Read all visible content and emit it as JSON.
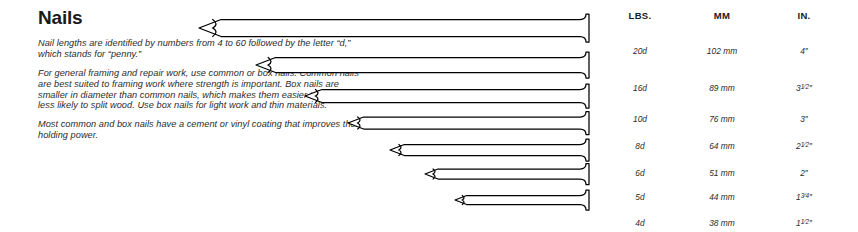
{
  "article": {
    "title": "Nails",
    "paragraphs": [
      "Nail lengths are identified by numbers from 4 to 60 followed by the letter “d,” which stands for “penny.”",
      "For general framing and repair work, use common or box nails. Common nails are best suited to framing work where strength is important. Box nails are smaller in diameter than common nails, which makes them easier to drive and less likely to split wood. Use box nails for light work and thin materials.",
      "Most common and box nails have a cement or vinyl coating that improves their holding power."
    ]
  },
  "table": {
    "headers": [
      "LBS.",
      "MM",
      "IN."
    ],
    "rows": [
      {
        "lbs": "20d",
        "mm": "102 mm",
        "in": "4″",
        "in_whole": "4",
        "in_frac": ""
      },
      {
        "lbs": "16d",
        "mm": "89 mm",
        "in": "3½″",
        "in_whole": "3",
        "in_frac": "1/2"
      },
      {
        "lbs": "10d",
        "mm": "76 mm",
        "in": "3″",
        "in_whole": "3",
        "in_frac": ""
      },
      {
        "lbs": "8d",
        "mm": "64 mm",
        "in": "2½″",
        "in_whole": "2",
        "in_frac": "1/2"
      },
      {
        "lbs": "6d",
        "mm": "51 mm",
        "in": "2″",
        "in_whole": "2",
        "in_frac": ""
      },
      {
        "lbs": "5d",
        "mm": "44 mm",
        "in": "1¾″",
        "in_whole": "1",
        "in_frac": "3/4"
      },
      {
        "lbs": "4d",
        "mm": "38 mm",
        "in": "1½″",
        "in_whole": "1",
        "in_frac": "1/2"
      }
    ]
  },
  "chart_data": {
    "type": "bar",
    "title": "Nails",
    "xlabel": "Length",
    "ylabel": "Nail size (penny)",
    "categories": [
      "20d",
      "16d",
      "10d",
      "8d",
      "6d",
      "5d",
      "4d"
    ],
    "series": [
      {
        "name": "Length (mm)",
        "values": [
          102,
          89,
          76,
          64,
          51,
          44,
          38
        ]
      },
      {
        "name": "Length (inches)",
        "values": [
          4,
          3.5,
          3,
          2.5,
          2,
          1.75,
          1.5
        ]
      }
    ],
    "orientation": "horizontal",
    "anchor": "right",
    "grid": false,
    "legend": "none",
    "xlim": [
      0,
      4
    ],
    "annotations": [
      "Nails are drawn to scale, heads aligned at right, points at left.",
      "Each row maps to one table row: penny size, millimetres, inches."
    ]
  },
  "nail_geometry": {
    "head_x": 586,
    "min_tip_x": 199,
    "row_centers": [
      28,
      65,
      96,
      123,
      150,
      174,
      200
    ],
    "shaft_half_height": [
      8.5,
      7.5,
      6.5,
      6.0,
      5.5,
      5.0,
      4.5
    ],
    "tip_x": [
      199,
      256,
      305,
      348,
      390,
      425,
      455
    ]
  },
  "colors": {
    "background": "#ffffff",
    "ink": "#1a1a1a",
    "body_text": "#2b2b2b",
    "nail_outline": "#000000",
    "nail_fill": "#ffffff"
  }
}
